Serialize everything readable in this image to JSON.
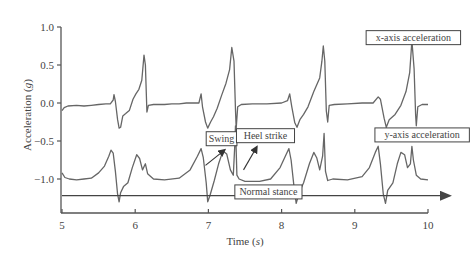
{
  "chart_data": {
    "type": "line",
    "title": "",
    "xlabel": "Time",
    "xlabel_unit": "s",
    "ylabel": "Acceleration",
    "ylabel_unit": "g",
    "xlim": [
      5,
      10
    ],
    "ylim": [
      -1.4,
      1.0
    ],
    "xticks": [
      5,
      6,
      7,
      8,
      9,
      10
    ],
    "xtick_labels": [
      "5",
      "6",
      "7",
      "8",
      "9",
      "10"
    ],
    "yticks": [
      1.0,
      0.5,
      0.0,
      -0.5,
      -1.0
    ],
    "ytick_labels": [
      "1.0",
      "0.5",
      "0.0",
      "−0.5",
      "−1.0"
    ],
    "grid": false,
    "legend": "none (inline boxed annotations)",
    "line_color": "#666666",
    "series": [
      {
        "name": "x-axis acceleration",
        "points": [
          [
            5.0,
            -0.1
          ],
          [
            5.03,
            -0.06
          ],
          [
            5.08,
            -0.04
          ],
          [
            5.2,
            -0.03
          ],
          [
            5.3,
            -0.04
          ],
          [
            5.4,
            -0.03
          ],
          [
            5.5,
            -0.02
          ],
          [
            5.6,
            -0.01
          ],
          [
            5.66,
            -0.01
          ],
          [
            5.7,
            0.04
          ],
          [
            5.71,
            0.11
          ],
          [
            5.73,
            0.02
          ],
          [
            5.76,
            -0.22
          ],
          [
            5.78,
            -0.33
          ],
          [
            5.8,
            -0.32
          ],
          [
            5.83,
            -0.17
          ],
          [
            5.87,
            -0.14
          ],
          [
            5.92,
            -0.1
          ],
          [
            5.97,
            0.05
          ],
          [
            6.01,
            0.12
          ],
          [
            6.05,
            0.18
          ],
          [
            6.09,
            0.3
          ],
          [
            6.12,
            0.63
          ],
          [
            6.14,
            0.5
          ],
          [
            6.16,
            -0.12
          ],
          [
            6.18,
            -0.03
          ],
          [
            6.25,
            -0.02
          ],
          [
            6.4,
            -0.02
          ],
          [
            6.5,
            -0.01
          ],
          [
            6.6,
            -0.01
          ],
          [
            6.7,
            0.0
          ],
          [
            6.82,
            0.0
          ],
          [
            6.87,
            0.0
          ],
          [
            6.9,
            0.12
          ],
          [
            6.92,
            -0.05
          ],
          [
            6.96,
            -0.25
          ],
          [
            6.99,
            -0.33
          ],
          [
            7.03,
            -0.25
          ],
          [
            7.07,
            -0.18
          ],
          [
            7.12,
            -0.07
          ],
          [
            7.18,
            0.1
          ],
          [
            7.24,
            0.26
          ],
          [
            7.29,
            0.44
          ],
          [
            7.32,
            0.73
          ],
          [
            7.35,
            0.55
          ],
          [
            7.37,
            -0.1
          ],
          [
            7.38,
            -0.33
          ],
          [
            7.4,
            -0.05
          ],
          [
            7.45,
            -0.02
          ],
          [
            7.6,
            -0.01
          ],
          [
            7.8,
            -0.01
          ],
          [
            8.0,
            0.0
          ],
          [
            8.08,
            0.03
          ],
          [
            8.11,
            0.12
          ],
          [
            8.14,
            -0.05
          ],
          [
            8.18,
            -0.26
          ],
          [
            8.21,
            -0.32
          ],
          [
            8.25,
            -0.22
          ],
          [
            8.3,
            -0.15
          ],
          [
            8.36,
            -0.05
          ],
          [
            8.44,
            0.15
          ],
          [
            8.52,
            0.33
          ],
          [
            8.55,
            0.55
          ],
          [
            8.57,
            0.75
          ],
          [
            8.59,
            0.55
          ],
          [
            8.61,
            -0.1
          ],
          [
            8.63,
            -0.25
          ],
          [
            8.65,
            -0.03
          ],
          [
            8.72,
            -0.02
          ],
          [
            8.9,
            -0.01
          ],
          [
            9.1,
            0.0
          ],
          [
            9.25,
            0.0
          ],
          [
            9.32,
            0.08
          ],
          [
            9.35,
            0.05
          ],
          [
            9.4,
            -0.2
          ],
          [
            9.43,
            -0.32
          ],
          [
            9.47,
            -0.22
          ],
          [
            9.55,
            -0.15
          ],
          [
            9.63,
            -0.03
          ],
          [
            9.7,
            0.15
          ],
          [
            9.75,
            0.4
          ],
          [
            9.78,
            0.82
          ],
          [
            9.81,
            0.45
          ],
          [
            9.83,
            -0.15
          ],
          [
            9.84,
            -0.3
          ],
          [
            9.86,
            -0.05
          ],
          [
            9.92,
            -0.02
          ],
          [
            10.0,
            -0.02
          ]
        ]
      },
      {
        "name": "y-axis acceleration",
        "points": [
          [
            5.0,
            -0.92
          ],
          [
            5.04,
            -0.98
          ],
          [
            5.1,
            -1.0
          ],
          [
            5.2,
            -1.01
          ],
          [
            5.3,
            -1.0
          ],
          [
            5.4,
            -0.99
          ],
          [
            5.5,
            -0.92
          ],
          [
            5.58,
            -0.83
          ],
          [
            5.64,
            -0.7
          ],
          [
            5.67,
            -0.62
          ],
          [
            5.7,
            -0.66
          ],
          [
            5.73,
            -0.9
          ],
          [
            5.76,
            -1.2
          ],
          [
            5.78,
            -1.3
          ],
          [
            5.8,
            -1.18
          ],
          [
            5.84,
            -1.1
          ],
          [
            5.9,
            -1.05
          ],
          [
            5.96,
            -0.85
          ],
          [
            6.02,
            -0.68
          ],
          [
            6.06,
            -0.73
          ],
          [
            6.1,
            -0.88
          ],
          [
            6.14,
            -0.8
          ],
          [
            6.17,
            -0.93
          ],
          [
            6.25,
            -1.0
          ],
          [
            6.4,
            -1.01
          ],
          [
            6.6,
            -0.99
          ],
          [
            6.75,
            -0.88
          ],
          [
            6.85,
            -0.7
          ],
          [
            6.9,
            -0.6
          ],
          [
            6.93,
            -0.72
          ],
          [
            6.97,
            -1.05
          ],
          [
            6.99,
            -1.3
          ],
          [
            7.02,
            -1.22
          ],
          [
            7.08,
            -1.02
          ],
          [
            7.14,
            -0.8
          ],
          [
            7.2,
            -0.63
          ],
          [
            7.25,
            -0.67
          ],
          [
            7.3,
            -0.88
          ],
          [
            7.34,
            -0.95
          ],
          [
            7.36,
            -0.55
          ],
          [
            7.37,
            -0.3
          ],
          [
            7.39,
            -0.95
          ],
          [
            7.42,
            -1.0
          ],
          [
            7.5,
            -1.03
          ],
          [
            7.7,
            -1.03
          ],
          [
            7.85,
            -1.0
          ],
          [
            7.98,
            -0.85
          ],
          [
            8.06,
            -0.68
          ],
          [
            8.1,
            -0.6
          ],
          [
            8.13,
            -0.75
          ],
          [
            8.17,
            -1.1
          ],
          [
            8.2,
            -1.32
          ],
          [
            8.24,
            -1.18
          ],
          [
            8.3,
            -1.05
          ],
          [
            8.38,
            -0.8
          ],
          [
            8.44,
            -0.65
          ],
          [
            8.48,
            -0.72
          ],
          [
            8.52,
            -0.88
          ],
          [
            8.56,
            -0.7
          ],
          [
            8.58,
            -0.4
          ],
          [
            8.6,
            -0.9
          ],
          [
            8.63,
            -1.02
          ],
          [
            8.7,
            -1.0
          ],
          [
            8.9,
            -1.01
          ],
          [
            9.1,
            -0.97
          ],
          [
            9.2,
            -0.85
          ],
          [
            9.28,
            -0.65
          ],
          [
            9.32,
            -0.57
          ],
          [
            9.35,
            -0.8
          ],
          [
            9.39,
            -1.2
          ],
          [
            9.42,
            -1.32
          ],
          [
            9.45,
            -1.15
          ],
          [
            9.52,
            -1.05
          ],
          [
            9.58,
            -0.8
          ],
          [
            9.63,
            -0.65
          ],
          [
            9.68,
            -0.68
          ],
          [
            9.72,
            -0.85
          ],
          [
            9.76,
            -0.8
          ],
          [
            9.78,
            -0.57
          ],
          [
            9.8,
            -0.75
          ],
          [
            9.84,
            -0.95
          ],
          [
            9.9,
            -1.0
          ],
          [
            10.0,
            -1.01
          ]
        ]
      }
    ],
    "annotations": [
      {
        "text": "x-axis acceleration",
        "x": 9.8,
        "y": 0.86
      },
      {
        "text": "y-axis acceleration",
        "x": 9.92,
        "y": -0.42
      },
      {
        "text": "Swing",
        "x": 7.18,
        "y": -0.47,
        "arrow_from": [
          6.96,
          -0.82
        ],
        "arrow_to": [
          7.22,
          -0.62
        ]
      },
      {
        "text": "Heel strike",
        "x": 7.78,
        "y": -0.43,
        "arrow_from": [
          7.48,
          -0.88
        ],
        "arrow_to": [
          7.66,
          -0.58
        ]
      },
      {
        "text": "Normal stance",
        "x": 7.82,
        "y": -1.17,
        "arrow_from": [
          5.0,
          -1.22
        ],
        "arrow_to": [
          10.3,
          -1.22
        ]
      }
    ]
  }
}
